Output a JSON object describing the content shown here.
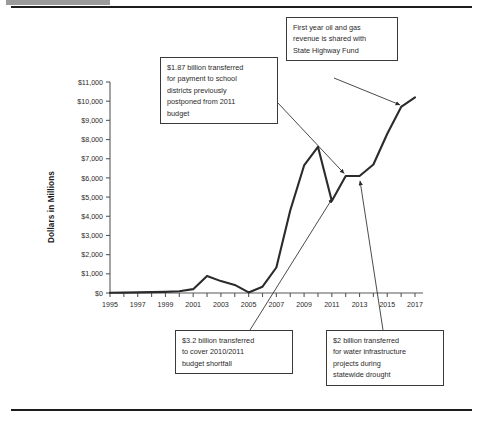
{
  "figure": {
    "top_rule": "horizontal-rule",
    "bottom_rule": "horizontal-rule",
    "corner_tab": "gray-tab"
  },
  "chart_data": {
    "type": "line",
    "title": "",
    "xlabel": "",
    "ylabel": "Dollars in Millions",
    "ylim": [
      0,
      11000
    ],
    "xlim": [
      1995,
      2017
    ],
    "grid": false,
    "legend": "none",
    "ytick_labels": [
      "$0",
      "$1,000",
      "$2,000",
      "$3,000",
      "$4,000",
      "$5,000",
      "$6,000",
      "$7,000",
      "$8,000",
      "$9,000",
      "$10,000",
      "$11,000"
    ],
    "ytick_values": [
      0,
      1000,
      2000,
      3000,
      4000,
      5000,
      6000,
      7000,
      8000,
      9000,
      10000,
      11000
    ],
    "xtick_labels": [
      "1995",
      "1997",
      "1999",
      "2001",
      "2003",
      "2005",
      "2007",
      "2009",
      "2011",
      "2013",
      "2015",
      "2017"
    ],
    "xtick_values": [
      1995,
      1997,
      1999,
      2001,
      2003,
      2005,
      2007,
      2009,
      2011,
      2013,
      2015,
      2017
    ],
    "x": [
      1995,
      1996,
      1997,
      1998,
      1999,
      2000,
      2001,
      2002,
      2003,
      2004,
      2005,
      2006,
      2007,
      2008,
      2009,
      2010,
      2011,
      2012,
      2013,
      2014,
      2015,
      2016,
      2017
    ],
    "values": [
      15,
      20,
      30,
      45,
      60,
      90,
      200,
      890,
      620,
      420,
      30,
      330,
      1330,
      4300,
      6650,
      7620,
      4800,
      6100,
      6100,
      6700,
      8300,
      9700,
      10200
    ],
    "series": [
      {
        "name": "Rainy Day Fund Balance",
        "values": [
          15,
          20,
          30,
          45,
          60,
          90,
          200,
          890,
          620,
          420,
          30,
          330,
          1330,
          4300,
          6650,
          7620,
          4800,
          6100,
          6100,
          6700,
          8300,
          9700,
          10200
        ]
      }
    ],
    "annotations": [
      {
        "id": "school-districts",
        "lines": [
          "$1.87 billion transferred",
          "for payment to school",
          "districts previously",
          "postponed from 2011",
          "budget"
        ],
        "points_to_year": 2012,
        "points_to_value": 6100
      },
      {
        "id": "oil-gas-highway-fund",
        "lines": [
          "First year oil and gas",
          "revenue is shared with",
          "State Highway Fund"
        ],
        "points_to_year": 2016,
        "points_to_value": 9700
      },
      {
        "id": "budget-shortfall",
        "lines": [
          "$3.2 billion transferred",
          "to cover 2010/2011",
          "budget shortfall"
        ],
        "points_to_year": 2011,
        "points_to_value": 4800
      },
      {
        "id": "water-infrastructure",
        "lines": [
          "$2 billion transferred",
          "for water infrastructure",
          "projects during",
          "statewide drought"
        ],
        "points_to_year": 2013,
        "points_to_value": 5900
      }
    ]
  }
}
